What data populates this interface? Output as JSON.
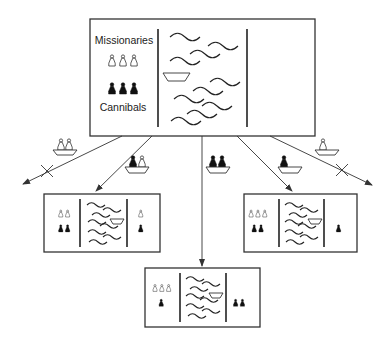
{
  "diagram": {
    "type": "state-transition tree",
    "puzzle": "Missionaries and Cannibals",
    "labels": {
      "missionaries": "Missionaries",
      "cannibals": "Cannibals"
    },
    "root": {
      "left_bank": {
        "missionaries": 3,
        "cannibals": 3
      },
      "boat_side": "left",
      "right_bank": {
        "missionaries": 0,
        "cannibals": 0
      }
    },
    "moves": [
      {
        "boat_carries": {
          "missionaries": 2,
          "cannibals": 0
        },
        "valid": false,
        "marker": "X"
      },
      {
        "boat_carries": {
          "missionaries": 1,
          "cannibals": 1
        },
        "valid": true,
        "result": {
          "left_bank": {
            "missionaries": 2,
            "cannibals": 2
          },
          "boat_side": "right",
          "right_bank": {
            "missionaries": 1,
            "cannibals": 1
          }
        }
      },
      {
        "boat_carries": {
          "missionaries": 0,
          "cannibals": 2
        },
        "valid": true,
        "result": {
          "left_bank": {
            "missionaries": 3,
            "cannibals": 1
          },
          "boat_side": "right",
          "right_bank": {
            "missionaries": 0,
            "cannibals": 2
          }
        }
      },
      {
        "boat_carries": {
          "missionaries": 0,
          "cannibals": 1
        },
        "valid": true,
        "result": {
          "left_bank": {
            "missionaries": 3,
            "cannibals": 2
          },
          "boat_side": "right",
          "right_bank": {
            "missionaries": 0,
            "cannibals": 1
          }
        }
      },
      {
        "boat_carries": {
          "missionaries": 1,
          "cannibals": 0
        },
        "valid": false,
        "marker": "X"
      }
    ],
    "colors": {
      "line": "#333333",
      "missionary_fill": "#ffffff",
      "cannibal_fill": "#111111",
      "background": "#ffffff"
    }
  }
}
